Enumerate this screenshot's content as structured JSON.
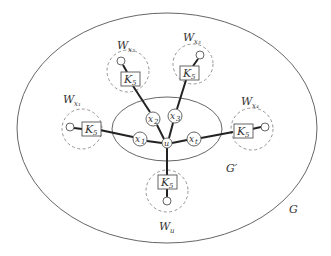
{
  "diagram": {
    "outer_graph": {
      "label": "G",
      "center": [
        167,
        128
      ],
      "rx": 150,
      "ry": 115
    },
    "inner_graph": {
      "label": "G'",
      "center": [
        167,
        129
      ],
      "rx": 55,
      "ry": 32
    },
    "hub": {
      "label": "u",
      "pos": [
        167,
        143
      ]
    },
    "inner_vertices": [
      {
        "id": "x1",
        "label": "x",
        "sub": "1",
        "pos": [
          140,
          139
        ]
      },
      {
        "id": "x2",
        "label": "x",
        "sub": "2",
        "pos": [
          153,
          119
        ]
      },
      {
        "id": "x3",
        "label": "x",
        "sub": "3",
        "pos": [
          175,
          116
        ]
      },
      {
        "id": "xt",
        "label": "x",
        "sub": "t",
        "pos": [
          194,
          139
        ]
      }
    ],
    "gadgets": [
      {
        "id": "Wx1",
        "label": "W",
        "sub": "x₁",
        "box_label": "K",
        "box_sub": "5",
        "region_center": [
          82,
          129
        ],
        "region_r": 20,
        "box": [
          91,
          129
        ],
        "leaf": [
          70,
          127
        ],
        "label_pos": [
          70,
          99
        ],
        "attached_to": "x1"
      },
      {
        "id": "Wx2",
        "label": "W",
        "sub": "x₂",
        "box_label": "K",
        "box_sub": "5",
        "region_center": [
          128,
          71
        ],
        "region_r": 21,
        "box": [
          130,
          79
        ],
        "leaf": [
          121,
          61
        ],
        "label_pos": [
          124,
          46
        ],
        "attached_to": "x2"
      },
      {
        "id": "Wx3",
        "label": "W",
        "sub": "x₃",
        "box_label": "K",
        "box_sub": "5",
        "region_center": [
          193,
          64
        ],
        "region_r": 20,
        "box": [
          189,
          73
        ],
        "leaf": [
          200,
          55
        ],
        "label_pos": [
          193,
          38
        ],
        "attached_to": "x3"
      },
      {
        "id": "Wx4",
        "label": "W",
        "sub": "x₄",
        "box_label": "K",
        "box_sub": "5",
        "region_center": [
          252,
          129
        ],
        "region_r": 21,
        "box": [
          243,
          131
        ],
        "leaf": [
          265,
          127
        ],
        "label_pos": [
          253,
          101
        ],
        "attached_to": "xt"
      },
      {
        "id": "Wu",
        "label": "W",
        "sub": "u",
        "box_label": "K",
        "box_sub": "5",
        "region_center": [
          167,
          191
        ],
        "region_r": 21,
        "box": [
          167,
          182
        ],
        "leaf": [
          167,
          201
        ],
        "label_pos": [
          167,
          227
        ],
        "attached_to": "u"
      }
    ],
    "labels": {
      "G": "G",
      "G_prime": "G′",
      "u": "u"
    }
  },
  "colors": {
    "stroke": "#555555",
    "thick_edge": "#222222",
    "dashed": "#888888",
    "text": "#333333",
    "background": "#ffffff"
  }
}
